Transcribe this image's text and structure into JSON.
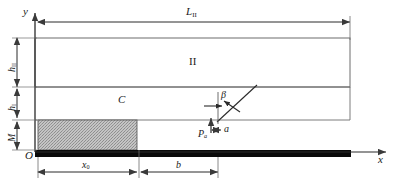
{
  "figure": {
    "type": "engineering-schematic",
    "axes": {
      "y_label": "y",
      "x_label": "x",
      "origin_label": "O"
    },
    "labels": {
      "length_total": "L",
      "length_total_sub": "II",
      "height_upper": "h",
      "height_upper_sub": "II",
      "height_lower": "h",
      "height_lower_sub": "I",
      "block_height": "M",
      "region_upper": "II",
      "region_lower": "C",
      "crack_angle": "β",
      "crack_length": "a",
      "load": "P",
      "load_sub": "a",
      "dim_x0": "x",
      "dim_x0_sub": "0",
      "dim_b": "b"
    },
    "colors": {
      "line": "#3a3a3a",
      "block_fill": "#b9b9b9",
      "base_bar": "#0a0a0a",
      "text": "#1a1a1a",
      "background": "#ffffff"
    },
    "geometry": {
      "y_axis_x": 35,
      "x_axis_y": 152,
      "region_II": {
        "x": 35,
        "y": 38,
        "w": 315,
        "h": 49
      },
      "region_C_top": 87,
      "region_C_bottom": 120,
      "block": {
        "x": 38,
        "y": 120,
        "w": 99,
        "h": 30
      },
      "base_bar": {
        "x": 35,
        "y": 150,
        "w": 316,
        "h": 7
      },
      "crack_from": [
        218,
        120
      ],
      "crack_to": [
        256,
        86
      ],
      "dim_top_y": 22,
      "dim_bottom_y": 172
    }
  }
}
